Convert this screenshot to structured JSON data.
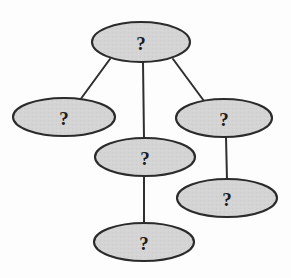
{
  "diagram": {
    "type": "node-link-tree",
    "background_color": "#fdfdfd",
    "node_fill_color": "#d4d4d4",
    "node_stroke_color": "#2b2b2b",
    "edge_color": "#2f2f2f",
    "label_color": "#1c1c1c",
    "node_count": 6,
    "edge_count": 5,
    "nodes": [
      {
        "id": "node-root",
        "label": "?",
        "cx": 141,
        "cy": 42,
        "rx": 49,
        "ry": 20,
        "font_size": 19
      },
      {
        "id": "node-left",
        "label": "?",
        "cx": 64,
        "cy": 117,
        "rx": 51,
        "ry": 19,
        "font_size": 19
      },
      {
        "id": "node-right",
        "label": "?",
        "cx": 224,
        "cy": 118,
        "rx": 48,
        "ry": 19,
        "font_size": 19
      },
      {
        "id": "node-middle",
        "label": "?",
        "cx": 145,
        "cy": 157,
        "rx": 50,
        "ry": 19,
        "font_size": 19
      },
      {
        "id": "node-lower-right",
        "label": "?",
        "cx": 227,
        "cy": 198,
        "rx": 50,
        "ry": 19,
        "font_size": 19
      },
      {
        "id": "node-bottom",
        "label": "?",
        "cx": 144,
        "cy": 242,
        "rx": 50,
        "ry": 19,
        "font_size": 19
      }
    ],
    "edges": [
      {
        "id": "edge-root-left",
        "from": "node-root",
        "to": "node-left",
        "x1": 110,
        "y1": 59,
        "x2": 80,
        "y2": 100
      },
      {
        "id": "edge-root-middle",
        "from": "node-root",
        "to": "node-middle",
        "x1": 143,
        "y1": 62,
        "x2": 144,
        "y2": 139
      },
      {
        "id": "edge-root-right",
        "from": "node-root",
        "to": "node-right",
        "x1": 173,
        "y1": 59,
        "x2": 204,
        "y2": 101
      },
      {
        "id": "edge-right-lowerright",
        "from": "node-right",
        "to": "node-lower-right",
        "x1": 226,
        "y1": 137,
        "x2": 227,
        "y2": 180
      },
      {
        "id": "edge-middle-bottom",
        "from": "node-middle",
        "to": "node-bottom",
        "x1": 144,
        "y1": 176,
        "x2": 144,
        "y2": 224
      }
    ]
  }
}
